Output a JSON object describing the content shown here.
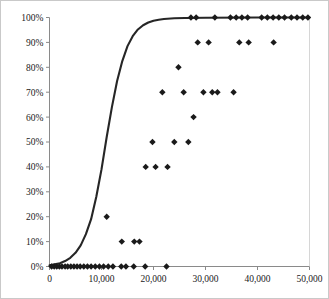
{
  "figure": {
    "frame_color": "#c9c9c9",
    "background": "#ffffff",
    "axis_color": "#8a8a8a",
    "marker_color": "#1a1a1a",
    "curve_color": "#262626"
  },
  "chart_data": {
    "type": "scatter",
    "title": "",
    "subtitle": "",
    "xlabel": "",
    "ylabel": "",
    "grid": false,
    "legend": false,
    "legend_position": "none",
    "xlim": [
      0,
      50000
    ],
    "ylim": [
      0,
      1.0
    ],
    "x_ticks": [
      0,
      10000,
      20000,
      30000,
      40000,
      50000
    ],
    "x_tick_labels": [
      "0",
      "10,000",
      "20,000",
      "30,000",
      "40,000",
      "50,000"
    ],
    "y_ticks": [
      0,
      0.1,
      0.2,
      0.3,
      0.4,
      0.5,
      0.6,
      0.7,
      0.8,
      0.9,
      1.0
    ],
    "y_tick_labels": [
      "0%",
      "10%",
      "20%",
      "30%",
      "40%",
      "50%",
      "60%",
      "70%",
      "80%",
      "90%",
      "100%"
    ],
    "marker": "diamond",
    "marker_size": 3.2,
    "series": [
      {
        "name": "observations",
        "type": "scatter",
        "points": [
          [
            400,
            0
          ],
          [
            900,
            0
          ],
          [
            1400,
            0
          ],
          [
            1900,
            0
          ],
          [
            2400,
            0
          ],
          [
            3000,
            0
          ],
          [
            3500,
            0
          ],
          [
            4100,
            0
          ],
          [
            4700,
            0
          ],
          [
            5300,
            0
          ],
          [
            5900,
            0
          ],
          [
            6600,
            0
          ],
          [
            7300,
            0
          ],
          [
            8000,
            0
          ],
          [
            8800,
            0
          ],
          [
            9600,
            0
          ],
          [
            10400,
            0
          ],
          [
            11300,
            0
          ],
          [
            12200,
            0
          ],
          [
            13800,
            0
          ],
          [
            14700,
            0
          ],
          [
            16200,
            0
          ],
          [
            18400,
            0
          ],
          [
            22500,
            0
          ],
          [
            13900,
            0.1
          ],
          [
            16300,
            0.1
          ],
          [
            17300,
            0.1
          ],
          [
            11000,
            0.2
          ],
          [
            18500,
            0.4
          ],
          [
            20400,
            0.4
          ],
          [
            22700,
            0.4
          ],
          [
            19800,
            0.5
          ],
          [
            24000,
            0.5
          ],
          [
            26700,
            0.5
          ],
          [
            27700,
            0.6
          ],
          [
            21700,
            0.7
          ],
          [
            25800,
            0.7
          ],
          [
            29600,
            0.7
          ],
          [
            31300,
            0.7
          ],
          [
            32300,
            0.7
          ],
          [
            35400,
            0.7
          ],
          [
            24800,
            0.8
          ],
          [
            28500,
            0.9
          ],
          [
            30600,
            0.9
          ],
          [
            36500,
            0.9
          ],
          [
            38300,
            0.9
          ],
          [
            43100,
            0.9
          ],
          [
            27200,
            1.0
          ],
          [
            28200,
            1.0
          ],
          [
            31800,
            1.0
          ],
          [
            34800,
            1.0
          ],
          [
            35900,
            1.0
          ],
          [
            37000,
            1.0
          ],
          [
            38100,
            1.0
          ],
          [
            40800,
            1.0
          ],
          [
            41900,
            1.0
          ],
          [
            43000,
            1.0
          ],
          [
            44100,
            1.0
          ],
          [
            45200,
            1.0
          ],
          [
            46500,
            1.0
          ],
          [
            47600,
            1.0
          ],
          [
            48700,
            1.0
          ],
          [
            49700,
            1.0
          ]
        ]
      },
      {
        "name": "fitted-logistic-curve",
        "type": "line",
        "description": "logistic curve rising from 0% near x=2,000 to 100% near x=22,000",
        "midpoint": 11500,
        "growth_rate": 0.00043,
        "points": [
          [
            0,
            0.005
          ],
          [
            2000,
            0.013
          ],
          [
            3000,
            0.022
          ],
          [
            4000,
            0.035
          ],
          [
            5000,
            0.055
          ],
          [
            6000,
            0.085
          ],
          [
            7000,
            0.13
          ],
          [
            8000,
            0.19
          ],
          [
            9000,
            0.28
          ],
          [
            10000,
            0.39
          ],
          [
            11000,
            0.52
          ],
          [
            12000,
            0.64
          ],
          [
            13000,
            0.745
          ],
          [
            14000,
            0.825
          ],
          [
            15000,
            0.885
          ],
          [
            16000,
            0.925
          ],
          [
            17000,
            0.952
          ],
          [
            18000,
            0.969
          ],
          [
            19000,
            0.98
          ],
          [
            20000,
            0.987
          ],
          [
            21000,
            0.991
          ],
          [
            22000,
            0.994
          ],
          [
            24000,
            0.997
          ],
          [
            26000,
            0.998
          ],
          [
            30000,
            0.999
          ],
          [
            40000,
            1.0
          ],
          [
            50000,
            1.0
          ]
        ]
      }
    ]
  }
}
